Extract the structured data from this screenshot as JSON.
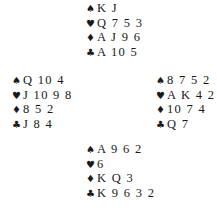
{
  "diagram": {
    "type": "bridge-deal",
    "suit_symbols": {
      "spades": "♠",
      "hearts": "♥",
      "diamonds": "♦",
      "clubs": "♣"
    },
    "hands": {
      "north": {
        "spades": "K J",
        "hearts": "Q 7 5 3",
        "diamonds": "A J 9 6",
        "clubs": "A 10 5"
      },
      "west": {
        "spades": "Q 10 4",
        "hearts": "J 10 9 8",
        "diamonds": "8 5 2",
        "clubs": "J 8 4"
      },
      "east": {
        "spades": "8 7 5 2",
        "hearts": "A K 4 2",
        "diamonds": "10 7 4",
        "clubs": "Q 7"
      },
      "south": {
        "spades": "A 9 6 2",
        "hearts": "6",
        "diamonds": "K Q 3",
        "clubs": "K 9 6 3 2"
      }
    }
  }
}
